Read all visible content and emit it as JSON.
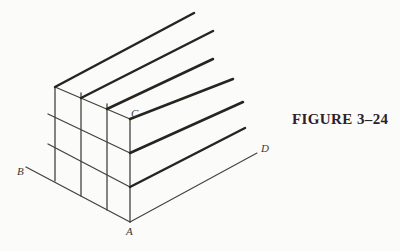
{
  "figure": {
    "caption": "FIGURE 3–24",
    "colors": {
      "background": "#fbfbf9",
      "ink_thin": "#44423b",
      "ink_bold": "#26241e",
      "label": "#3a3830",
      "caption": "#2e2026"
    },
    "labels": [
      {
        "text": "B",
        "x": 17,
        "y": 175
      },
      {
        "text": "A",
        "x": 126,
        "y": 235
      },
      {
        "text": "C",
        "x": 131,
        "y": 117
      },
      {
        "text": "D",
        "x": 261,
        "y": 152
      }
    ],
    "segments": {
      "vertical_lines": {
        "name": "grid-vertical-line",
        "width": 1.3,
        "color_key": "ink_thin",
        "lines": [
          [
            55,
            87,
            55,
            181
          ],
          [
            81,
            93,
            81,
            196
          ],
          [
            107,
            104,
            107,
            210
          ],
          [
            130,
            119,
            130,
            222
          ]
        ]
      },
      "ab_lines": {
        "name": "grid-ab-line",
        "width": 1.3,
        "color_key": "ink_thin",
        "lines": [
          [
            55,
            87,
            130,
            119
          ],
          [
            48,
            114,
            130,
            153
          ],
          [
            48,
            144,
            130,
            187
          ],
          [
            26,
            167,
            130,
            222
          ]
        ]
      },
      "ad_rays_bold": {
        "name": "parallel-ray",
        "width": 2.5,
        "color_key": "ink_bold",
        "lines": [
          [
            55,
            87,
            194,
            13
          ],
          [
            81,
            98,
            213,
            31
          ],
          [
            107,
            109,
            213,
            59
          ],
          [
            130,
            119,
            233,
            79
          ],
          [
            130,
            153,
            243,
            102
          ],
          [
            130,
            187,
            245,
            128
          ]
        ]
      },
      "ad_lines_thin": {
        "name": "line-ad",
        "width": 1.1,
        "color_key": "ink_thin",
        "lines": [
          [
            130,
            222,
            257,
            153
          ]
        ]
      }
    }
  }
}
